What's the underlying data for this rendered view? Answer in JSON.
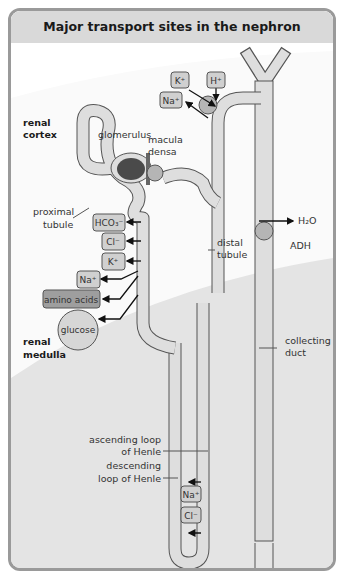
{
  "title": "Major  transport sites in the nephron",
  "regions": {
    "cortex": [
      "renal",
      "cortex"
    ],
    "medulla": [
      "renal",
      "medulla"
    ]
  },
  "labels": {
    "glomerulus": "glomerulus",
    "macula_densa": [
      "macula",
      "densa"
    ],
    "proximal_tubule": [
      "proximal",
      "tubule"
    ],
    "distal_tubule": [
      "distal",
      "tubule"
    ],
    "collecting_duct": [
      "collecting",
      "duct"
    ],
    "ascending_loop": [
      "ascending loop",
      "of Henle"
    ],
    "descending_loop": [
      "descending",
      "loop of Henle"
    ],
    "adh": "ADH",
    "water": "H₂O"
  },
  "proximal_transport": [
    {
      "ion": "HCO₃⁻",
      "direction": "in"
    },
    {
      "ion": "Cl⁻",
      "direction": "in"
    },
    {
      "ion": "K⁺",
      "direction": "in"
    },
    {
      "ion": "Na⁺",
      "direction": "out"
    },
    {
      "ion": "amino acids",
      "direction": "out"
    },
    {
      "ion": "glucose",
      "direction": "out"
    }
  ],
  "distal_transport": [
    {
      "ion": "K⁺",
      "direction": "in"
    },
    {
      "ion": "H⁺",
      "direction": "in"
    },
    {
      "ion": "Na⁺",
      "direction": "out"
    }
  ],
  "loop_transport": [
    {
      "ion": "Na⁺"
    },
    {
      "ion": "Cl⁻"
    }
  ],
  "colors": {
    "header": "#d9d9d9",
    "cortex_bg": "#fafafa",
    "medulla_bg": "#e4e4e4",
    "tubule_fill": "#dedede",
    "outline": "#555555",
    "glomerulus": "#4a4a4a",
    "cell": "#b5b5b5",
    "amino_acids_box": "#9e9e9e"
  }
}
